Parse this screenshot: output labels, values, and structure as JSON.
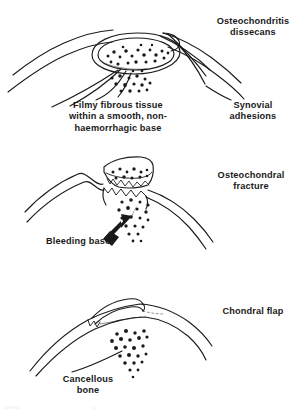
{
  "figure": {
    "background_color": "#ffffff",
    "ink_color": "#1a1a1a",
    "panel_count": 3
  },
  "panels": [
    {
      "id": "osteochondritis-dissecans",
      "heading": "Osteochondritis\ndissecans",
      "annotations": [
        {
          "name": "base-description",
          "text": "Filmy fibrous tissue\nwithin a smooth, non-\nhaemorrhagic base"
        },
        {
          "name": "synovial-adhesions",
          "text": "Synovial\nadhesions"
        }
      ]
    },
    {
      "id": "osteochondral-fracture",
      "heading": "Osteochondral\nfracture",
      "annotations": [
        {
          "name": "bleeding-base",
          "text": "Bleeding base"
        }
      ]
    },
    {
      "id": "chondral-flap",
      "heading": "Chondral flap",
      "annotations": [
        {
          "name": "cancellous-bone",
          "text": "Cancellous\nbone"
        }
      ]
    }
  ],
  "labels": {
    "osteochondritis_dissecans": "Osteochondritis\ndissecans",
    "filmy_fibrous_tissue": "Filmy fibrous tissue\nwithin a smooth, non-\nhaemorrhagic base",
    "synovial_adhesions": "Synovial\nadhesions",
    "osteochondral_fracture": "Osteochondral\nfracture",
    "bleeding_base": "Bleeding base",
    "chondral_flap": "Chondral flap",
    "cancellous_bone": "Cancellous\nbone"
  }
}
